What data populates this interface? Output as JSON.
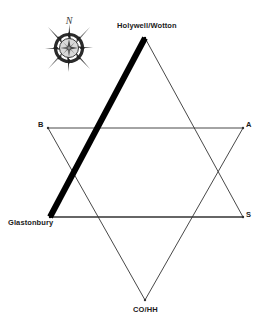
{
  "figure": {
    "background_color": "#ffffff",
    "line_color": "#333333",
    "bold_line_color": "#000000",
    "text_color": "#1a1a1a"
  },
  "compass": {
    "name": "compass-rose",
    "north_glyph": "N",
    "center_x": 69,
    "center_y": 48,
    "radius": 19,
    "body_color": "#4a4a4a",
    "highlight_color": "#d8d8d8"
  },
  "vertices": [
    {
      "id": "holywell",
      "label": "Holywell/Wotton",
      "x": 145,
      "y": 38
    },
    {
      "id": "b",
      "label": "B",
      "x": 48,
      "y": 128
    },
    {
      "id": "a",
      "label": "A",
      "x": 243,
      "y": 128
    },
    {
      "id": "glastonbury",
      "label": "Glastonbury",
      "x": 50,
      "y": 217
    },
    {
      "id": "s",
      "label": "S",
      "x": 243,
      "y": 217
    },
    {
      "id": "cohh",
      "label": "CO/HH",
      "x": 145,
      "y": 300
    }
  ],
  "edges": [
    {
      "id": "glastonbury-holywell",
      "from": "glastonbury",
      "to": "holywell",
      "weight": "bold",
      "stroke_width": 6
    },
    {
      "id": "holywell-s",
      "from": "holywell",
      "to": "s",
      "weight": "thin",
      "stroke_width": 0.9
    },
    {
      "id": "s-glastonbury",
      "from": "s",
      "to": "glastonbury",
      "weight": "thin",
      "stroke_width": 0.9
    },
    {
      "id": "b-a",
      "from": "b",
      "to": "a",
      "weight": "thin",
      "stroke_width": 0.9
    },
    {
      "id": "a-cohh",
      "from": "a",
      "to": "cohh",
      "weight": "thin",
      "stroke_width": 0.9
    },
    {
      "id": "cohh-b",
      "from": "cohh",
      "to": "b",
      "weight": "thin",
      "stroke_width": 0.9
    }
  ]
}
